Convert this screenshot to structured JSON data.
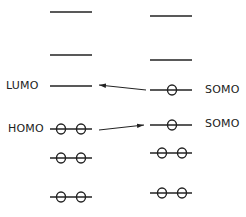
{
  "diagram": {
    "type": "molecular-orbital-energy-levels",
    "left_column": {
      "levels": [
        {
          "y": 12,
          "electrons": 0,
          "label": ""
        },
        {
          "y": 55,
          "electrons": 0,
          "label": ""
        },
        {
          "y": 86,
          "electrons": 0,
          "label": "LUMO"
        },
        {
          "y": 129,
          "electrons": 2,
          "label": "HOMO"
        },
        {
          "y": 158,
          "electrons": 2,
          "label": ""
        },
        {
          "y": 197,
          "electrons": 2,
          "label": ""
        }
      ]
    },
    "right_column": {
      "levels": [
        {
          "y": 16,
          "electrons": 0,
          "label": ""
        },
        {
          "y": 60,
          "electrons": 0,
          "label": ""
        },
        {
          "y": 90,
          "electrons": 1,
          "label": "SOMO"
        },
        {
          "y": 125,
          "electrons": 1,
          "label": "SOMO"
        },
        {
          "y": 153,
          "electrons": 2,
          "label": ""
        },
        {
          "y": 193,
          "electrons": 2,
          "label": ""
        }
      ]
    },
    "arrows": [
      {
        "from": "SOMO (upper)",
        "to": "LUMO",
        "direction": "left"
      },
      {
        "from": "HOMO",
        "to": "SOMO (lower)",
        "direction": "right"
      }
    ],
    "labels": {
      "lumo": "LUMO",
      "homo": "HOMO",
      "somo_upper": "SOMO",
      "somo_lower": "SOMO"
    },
    "colors": {
      "line": "#222222"
    }
  }
}
